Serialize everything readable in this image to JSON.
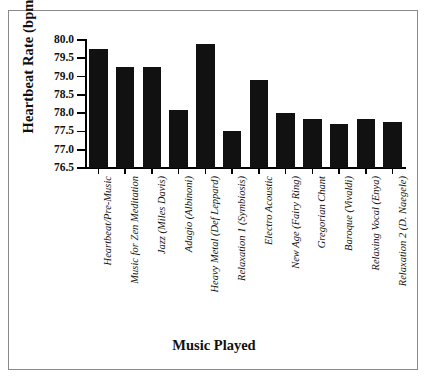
{
  "chart_data": {
    "type": "bar",
    "title": "",
    "xlabel": "Music Played",
    "ylabel": "Heartbeat Rate (bpm)",
    "ylim": [
      76.5,
      80.0
    ],
    "ytick_labels": [
      "80.0",
      "79.5",
      "79.0",
      "78.5",
      "78.0",
      "77.5",
      "77.0",
      "76.5"
    ],
    "yticks": [
      80.0,
      79.5,
      79.0,
      78.5,
      78.0,
      77.5,
      77.0,
      76.5
    ],
    "grid": false,
    "legend": null,
    "bar_color": "#111111",
    "categories": [
      "Heartbeat/Pre-Music",
      "Music for Zen Meditation",
      "Jazz (Miles Davis)",
      "Adagio (Albinoni)",
      "Heavy Metal (Def Leppard)",
      "Relaxation 1 (Symbiosis)",
      "Electro Acoustic",
      "New Age (Fairy Ring)",
      "Gregorian Chant",
      "Baroque (Vivaldi)",
      "Relaxing Vocal (Enya)",
      "Relaxation 2 (D. Naegele)"
    ],
    "values": [
      79.75,
      79.25,
      79.25,
      78.1,
      79.9,
      77.5,
      78.9,
      78.0,
      77.85,
      77.7,
      77.85,
      77.75
    ]
  },
  "axes": {
    "y_title": "Heartbeat Rate (bpm)",
    "x_title": "Music Played"
  }
}
